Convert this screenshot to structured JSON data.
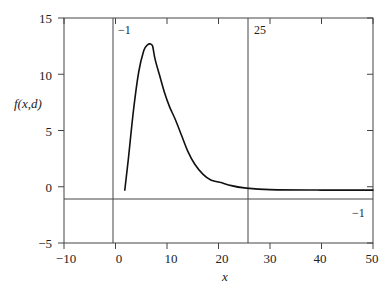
{
  "chart_data": {
    "type": "line",
    "title": "",
    "xlabel": "x",
    "ylabel": "f(x,d)",
    "xlim": [
      -10,
      50
    ],
    "ylim": [
      -5,
      15
    ],
    "xticks": [
      -10,
      0,
      10,
      20,
      30,
      40,
      50
    ],
    "yticks": [
      -5,
      0,
      5,
      10,
      15
    ],
    "xtick_labels": [
      "−10",
      "0",
      "10",
      "20",
      "30",
      "40",
      "50"
    ],
    "ytick_labels": [
      "−5",
      "0",
      "5",
      "10",
      "15"
    ],
    "grid": false,
    "legend": null,
    "series": [
      {
        "name": "f(x,d)",
        "x": [
          1.8,
          2.5,
          3.5,
          4.5,
          5.5,
          6.2,
          6.7,
          7.2,
          7.7,
          8.5,
          9.5,
          10.5,
          11.6,
          12.8,
          14.0,
          15.4,
          17.0,
          18.5,
          20.3,
          22.5,
          25.0,
          30.0,
          40.0,
          50.0
        ],
        "y": [
          -0.3,
          2.5,
          6.8,
          10.2,
          12.1,
          12.6,
          12.7,
          12.5,
          11.3,
          10.0,
          8.4,
          7.1,
          6.0,
          4.6,
          3.2,
          2.0,
          1.1,
          0.6,
          0.4,
          0.1,
          -0.1,
          -0.25,
          -0.3,
          -0.3
        ]
      }
    ],
    "reference_lines": [
      {
        "orientation": "vertical",
        "value": -1,
        "label": "−1"
      },
      {
        "orientation": "vertical",
        "value": 25,
        "label": "25"
      },
      {
        "orientation": "horizontal",
        "value": -1,
        "label": "−1"
      }
    ],
    "colors": {
      "line": "#111111",
      "axes": "#333333",
      "background": "#ffffff"
    }
  },
  "labels": {
    "xlabel": "x",
    "ylabel": "f(x,d)",
    "vline_left": "−1",
    "vline_right": "25",
    "hline": "−1",
    "xticks": [
      "−10",
      "0",
      "10",
      "20",
      "30",
      "40",
      "50"
    ],
    "yticks": [
      "15",
      "10",
      "5",
      "0",
      "−5"
    ]
  }
}
